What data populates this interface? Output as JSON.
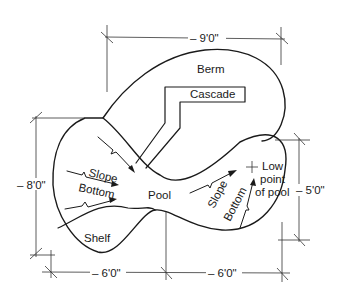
{
  "diagram": {
    "type": "pool-plan",
    "labels": {
      "berm": "Berm",
      "cascade": "Cascade",
      "pool": "Pool",
      "shelf": "Shelf",
      "slope_left": "Slope",
      "bottom_left": "Bottom",
      "slope_right": "Slope",
      "bottom_right": "Bottom",
      "low_point_1": "Low",
      "low_point_2": "point",
      "low_point_3": "of pool"
    },
    "dimensions": {
      "top_width": "– 9'0\"",
      "left_height": "– 8'0\"",
      "right_height": "– 5'0\"",
      "bottom_left_width": "– 6'0\"",
      "bottom_right_width": "– 6'0\""
    },
    "colors": {
      "line": "#1a1a1a",
      "background": "#ffffff"
    }
  }
}
